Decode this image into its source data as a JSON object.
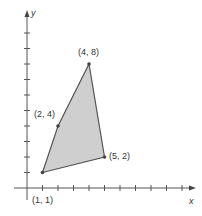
{
  "diagram": {
    "type": "polygon-on-coordinate-plane",
    "axes": {
      "x_label": "x",
      "y_label": "y",
      "x_ticks": 10,
      "y_ticks": 10
    },
    "polygon": {
      "fill": "#cfcfcf",
      "stroke": "#555555",
      "vertices": [
        {
          "x": 1,
          "y": 1,
          "label": "(1, 1)"
        },
        {
          "x": 2,
          "y": 4,
          "label": "(2, 4)"
        },
        {
          "x": 4,
          "y": 8,
          "label": "(4, 8)"
        },
        {
          "x": 5,
          "y": 2,
          "label": "(5, 2)"
        }
      ]
    }
  }
}
